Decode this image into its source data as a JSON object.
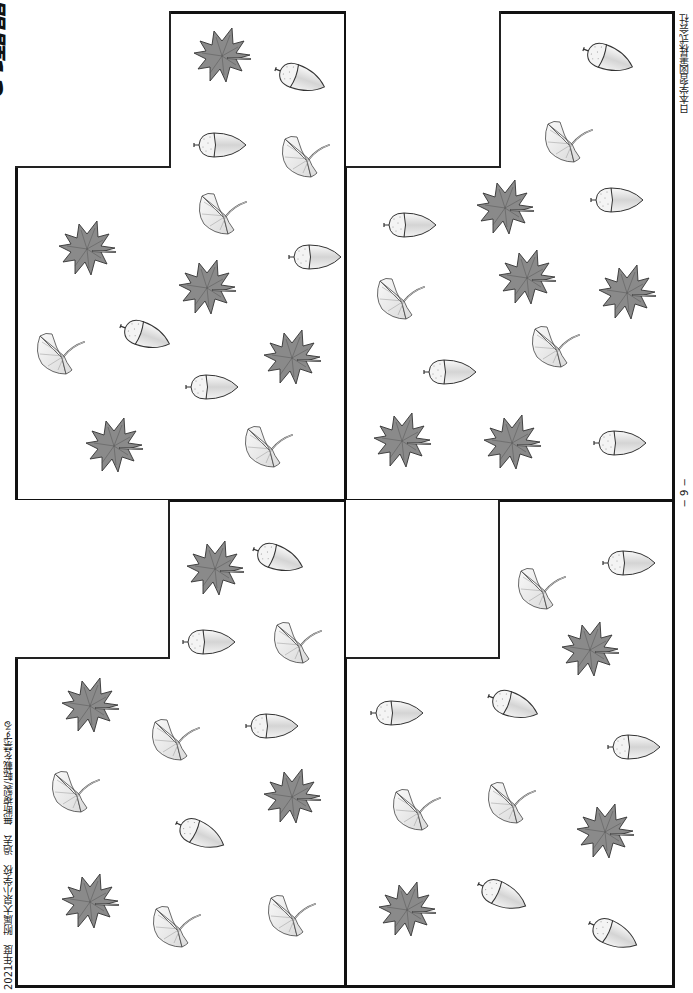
{
  "page": {
    "title": "問題12",
    "publisher": "日本学習図書株式会社",
    "page_number": "− 9 −",
    "footer": "2021年度　附属大泉小学校　過去　無断複製/転載を禁ずる"
  },
  "colors": {
    "border": "#111111",
    "maple_fill": "#8a8a8a",
    "ginkgo_fill": "#ececec",
    "acorn_cap": "#f0f0f0",
    "acorn_body": "#d8d8d8"
  },
  "panels": [
    {
      "id": "top-left",
      "answer_box": {
        "x": 15,
        "y": 11,
        "w": 156,
        "h": 157
      },
      "items": [
        {
          "type": "maple",
          "x": 220,
          "y": 55,
          "rot": 0
        },
        {
          "type": "acorn",
          "x": 300,
          "y": 78,
          "rot": 20
        },
        {
          "type": "acorn",
          "x": 220,
          "y": 145,
          "rot": 0
        },
        {
          "type": "ginkgo",
          "x": 305,
          "y": 155,
          "rot": 0
        },
        {
          "type": "ginkgo",
          "x": 222,
          "y": 212,
          "rot": 0
        },
        {
          "type": "acorn",
          "x": 315,
          "y": 257,
          "rot": 0
        },
        {
          "type": "maple",
          "x": 85,
          "y": 248,
          "rot": 0
        },
        {
          "type": "maple",
          "x": 205,
          "y": 287,
          "rot": 0
        },
        {
          "type": "acorn",
          "x": 145,
          "y": 335,
          "rot": 20
        },
        {
          "type": "ginkgo",
          "x": 60,
          "y": 352,
          "rot": 0
        },
        {
          "type": "maple",
          "x": 290,
          "y": 357,
          "rot": 0
        },
        {
          "type": "acorn",
          "x": 212,
          "y": 387,
          "rot": 0
        },
        {
          "type": "maple",
          "x": 112,
          "y": 445,
          "rot": 0
        },
        {
          "type": "ginkgo",
          "x": 268,
          "y": 445,
          "rot": 0
        }
      ]
    },
    {
      "id": "top-right",
      "answer_box": {
        "x": 346,
        "y": 11,
        "w": 155,
        "h": 157
      },
      "items": [
        {
          "type": "acorn",
          "x": 608,
          "y": 58,
          "rot": 20
        },
        {
          "type": "ginkgo",
          "x": 568,
          "y": 140,
          "rot": 0
        },
        {
          "type": "acorn",
          "x": 617,
          "y": 200,
          "rot": 0
        },
        {
          "type": "maple",
          "x": 503,
          "y": 207,
          "rot": 0
        },
        {
          "type": "acorn",
          "x": 410,
          "y": 225,
          "rot": 0
        },
        {
          "type": "maple",
          "x": 525,
          "y": 277,
          "rot": 0
        },
        {
          "type": "maple",
          "x": 625,
          "y": 292,
          "rot": 0
        },
        {
          "type": "ginkgo",
          "x": 400,
          "y": 297,
          "rot": 0
        },
        {
          "type": "ginkgo",
          "x": 555,
          "y": 345,
          "rot": 0
        },
        {
          "type": "acorn",
          "x": 450,
          "y": 372,
          "rot": 0
        },
        {
          "type": "maple",
          "x": 400,
          "y": 440,
          "rot": 0
        },
        {
          "type": "maple",
          "x": 510,
          "y": 442,
          "rot": 0
        },
        {
          "type": "acorn",
          "x": 620,
          "y": 443,
          "rot": 0
        }
      ]
    },
    {
      "id": "bottom-left",
      "answer_box": {
        "x": 15,
        "y": 500,
        "w": 155,
        "h": 159
      },
      "items": [
        {
          "type": "maple",
          "x": 213,
          "y": 568,
          "rot": 0
        },
        {
          "type": "acorn",
          "x": 278,
          "y": 558,
          "rot": 20
        },
        {
          "type": "acorn",
          "x": 209,
          "y": 642,
          "rot": 0
        },
        {
          "type": "ginkgo",
          "x": 297,
          "y": 641,
          "rot": 0
        },
        {
          "type": "maple",
          "x": 88,
          "y": 705,
          "rot": 0
        },
        {
          "type": "ginkgo",
          "x": 175,
          "y": 738,
          "rot": 0
        },
        {
          "type": "acorn",
          "x": 272,
          "y": 726,
          "rot": 0
        },
        {
          "type": "ginkgo",
          "x": 75,
          "y": 790,
          "rot": 0
        },
        {
          "type": "maple",
          "x": 290,
          "y": 796,
          "rot": 0
        },
        {
          "type": "acorn",
          "x": 200,
          "y": 834,
          "rot": 25
        },
        {
          "type": "maple",
          "x": 88,
          "y": 901,
          "rot": 0
        },
        {
          "type": "ginkgo",
          "x": 176,
          "y": 925,
          "rot": 0
        },
        {
          "type": "ginkgo",
          "x": 291,
          "y": 914,
          "rot": 0
        }
      ]
    },
    {
      "id": "bottom-right",
      "answer_box": {
        "x": 346,
        "y": 500,
        "w": 154,
        "h": 159
      },
      "items": [
        {
          "type": "acorn",
          "x": 629,
          "y": 563,
          "rot": 0
        },
        {
          "type": "ginkgo",
          "x": 541,
          "y": 587,
          "rot": 0
        },
        {
          "type": "maple",
          "x": 588,
          "y": 649,
          "rot": 0
        },
        {
          "type": "acorn",
          "x": 397,
          "y": 713,
          "rot": 0
        },
        {
          "type": "acorn",
          "x": 513,
          "y": 705,
          "rot": 20
        },
        {
          "type": "acorn",
          "x": 634,
          "y": 747,
          "rot": 0
        },
        {
          "type": "ginkgo",
          "x": 416,
          "y": 808,
          "rot": 0
        },
        {
          "type": "ginkgo",
          "x": 511,
          "y": 801,
          "rot": 0
        },
        {
          "type": "maple",
          "x": 603,
          "y": 831,
          "rot": 0
        },
        {
          "type": "maple",
          "x": 405,
          "y": 909,
          "rot": 0
        },
        {
          "type": "acorn",
          "x": 502,
          "y": 895,
          "rot": 25
        },
        {
          "type": "acorn",
          "x": 613,
          "y": 934,
          "rot": 25
        }
      ]
    }
  ]
}
